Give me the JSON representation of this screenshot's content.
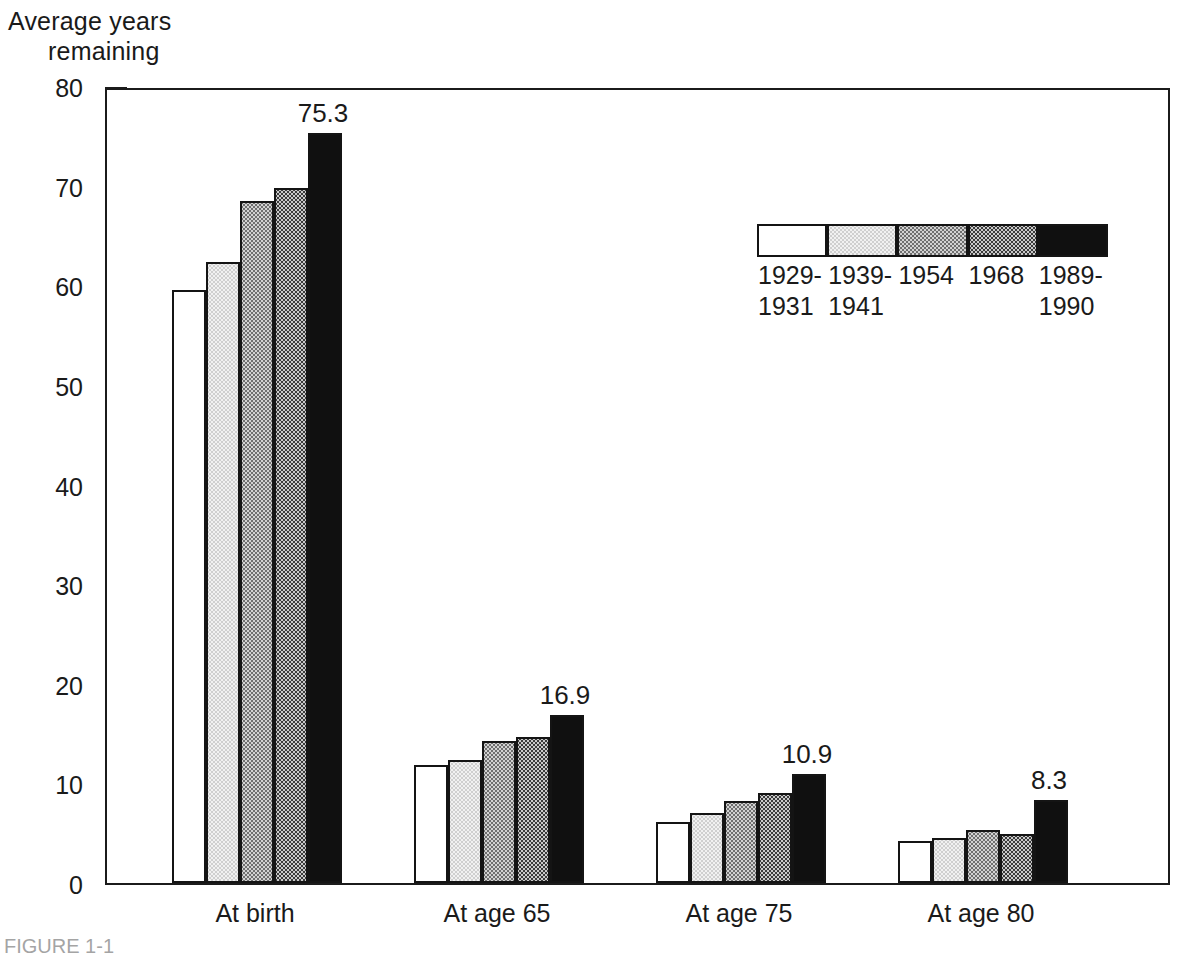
{
  "axis_title": {
    "line1": "Average years",
    "line2": "remaining"
  },
  "caption": "FIGURE 1-1",
  "legend": {
    "items": [
      {
        "label_line1": "1929-",
        "label_line2": "1931",
        "fill": "white",
        "color": "#ffffff"
      },
      {
        "label_line1": "1939-",
        "label_line2": "1941",
        "fill": "light",
        "color": "#f1f1f1"
      },
      {
        "label_line1": "1954",
        "label_line2": "",
        "fill": "mid",
        "color": "#d2d2d2"
      },
      {
        "label_line1": "1968",
        "label_line2": "",
        "fill": "dark",
        "color": "#3a3a3a"
      },
      {
        "label_line1": "1989-",
        "label_line2": "1990",
        "fill": "black",
        "color": "#101010"
      }
    ]
  },
  "chart_data": {
    "type": "bar",
    "title": "",
    "subtitle": "",
    "xlabel": "",
    "ylabel": "Average years remaining",
    "ylim": [
      0,
      80
    ],
    "yticks": [
      0,
      10,
      20,
      30,
      40,
      50,
      60,
      70,
      80
    ],
    "grid": false,
    "legend_position": "inside-top-right",
    "categories": [
      "At birth",
      "At age 65",
      "At age 75",
      "At age 80"
    ],
    "series": [
      {
        "name": "1929-1931",
        "values": [
          59.5,
          11.8,
          6.1,
          4.2
        ]
      },
      {
        "name": "1939-1941",
        "values": [
          62.3,
          12.3,
          7.0,
          4.5
        ]
      },
      {
        "name": "1954",
        "values": [
          68.5,
          14.3,
          8.2,
          5.3
        ]
      },
      {
        "name": "1968",
        "values": [
          69.8,
          14.7,
          9.0,
          4.9
        ]
      },
      {
        "name": "1989-1990",
        "values": [
          75.3,
          16.9,
          10.9,
          8.3
        ]
      }
    ],
    "annotations": [
      {
        "category": "At birth",
        "series": "1989-1990",
        "text": "75.3"
      },
      {
        "category": "At age 65",
        "series": "1989-1990",
        "text": "16.9"
      },
      {
        "category": "At age 75",
        "series": "1989-1990",
        "text": "10.9"
      },
      {
        "category": "At age 80",
        "series": "1989-1990",
        "text": "8.3"
      }
    ]
  }
}
